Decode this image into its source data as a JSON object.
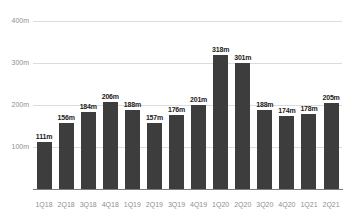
{
  "chart_data": {
    "type": "bar",
    "title": "",
    "xlabel": "",
    "ylabel": "",
    "categories": [
      "1Q18",
      "2Q18",
      "3Q18",
      "4Q18",
      "1Q19",
      "2Q19",
      "3Q19",
      "4Q19",
      "1Q20",
      "2Q20",
      "3Q20",
      "4Q20",
      "1Q21",
      "2Q21"
    ],
    "values": [
      111,
      156,
      184,
      206,
      188,
      157,
      176,
      201,
      318,
      301,
      188,
      174,
      178,
      205
    ],
    "value_labels": [
      "111m",
      "156m",
      "184m",
      "206m",
      "188m",
      "157m",
      "176m",
      "201m",
      "318m",
      "301m",
      "188m",
      "174m",
      "178m",
      "205m"
    ],
    "ylim": [
      0,
      400
    ],
    "y_ticks": [
      {
        "value": 100,
        "label": "100m"
      },
      {
        "value": 200,
        "label": "200m"
      },
      {
        "value": 300,
        "label": "300m"
      },
      {
        "value": 400,
        "label": "400m"
      }
    ],
    "grid": "horizontal",
    "legend": "none"
  },
  "colors": {
    "background": "#ffffff",
    "bar": "#3d3d3d",
    "grid_line": "#dcdcdc",
    "axis_line": "#7d7d7d",
    "axis_text": "#8f8f8f",
    "value_label_text": "#1b1b1b"
  }
}
